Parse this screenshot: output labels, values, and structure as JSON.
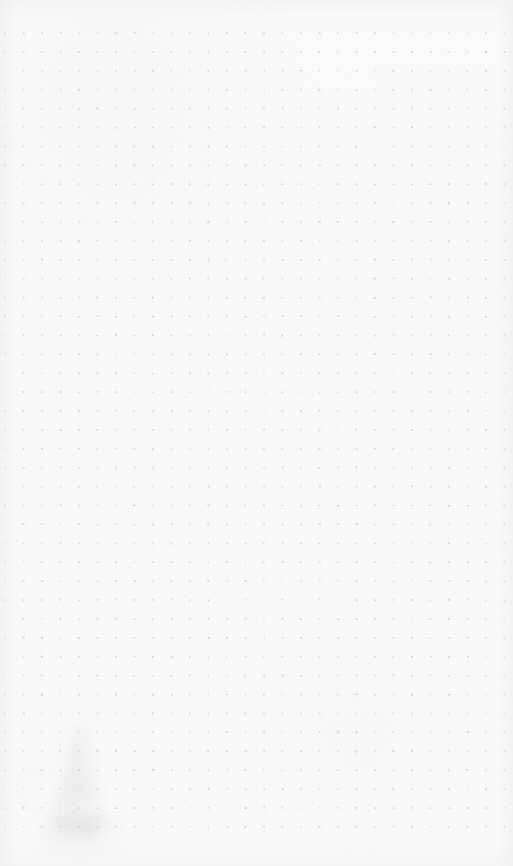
{
  "page": {
    "kind": "scanned-dot-grid-notebook-page",
    "width_px": 513,
    "height_px": 866,
    "paper_color": "#fbfbfb",
    "has_text": false,
    "has_handwriting": false,
    "visible_text": ""
  },
  "dot_grid": {
    "dot_color": "#c9c9cf",
    "dot_radius_px": 0.9,
    "spacing_x_px": 18.5,
    "spacing_y_px": 18.9,
    "origin_x_px": 5,
    "origin_y_px": 33,
    "columns": 28,
    "rows": 43,
    "last_dot_x_px": 505,
    "last_dot_y_px": 828,
    "top_margin_px": 33,
    "bottom_margin_px": 38
  },
  "artifacts": {
    "bleed_through": {
      "label": "faint ghost silhouette bleeding through from reverse side",
      "region_x_px": 8,
      "region_y_px": 694,
      "region_width_px": 140,
      "region_height_px": 172,
      "opacity": 0.4,
      "color": "#c6c6cc"
    },
    "bottom_smudge": {
      "label": "faint smudge near bottom-left edge",
      "region_x_px": 34,
      "region_y_px": 812,
      "region_width_px": 96,
      "region_height_px": 34
    },
    "vignette": {
      "label": "scanner edge shading",
      "color": "#ececee"
    },
    "paper_grain": {
      "label": "scanned paper fiber texture",
      "opacity": 0.55
    }
  }
}
